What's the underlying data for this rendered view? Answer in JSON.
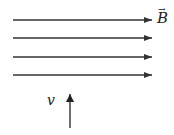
{
  "diagram": {
    "field": {
      "label": "B",
      "vector_mark": "→",
      "direction": "right",
      "line_count": 4,
      "line_y": [
        20,
        38,
        57,
        75
      ],
      "x_start": 13,
      "x_end": 152
    },
    "velocity": {
      "label": "v",
      "direction": "up",
      "x": 70,
      "y_start": 128,
      "y_end": 94
    },
    "colors": {
      "line": "#333333",
      "background": "#ffffff"
    }
  }
}
